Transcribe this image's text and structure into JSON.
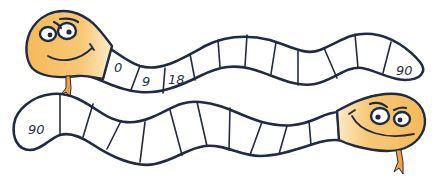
{
  "puzzle": {
    "description": "Two snake number tracks counting by 9 from 0 to 90",
    "colors": {
      "outline": "#1f2a44",
      "head_fill": "#f7c06b",
      "head_highlight": "#fde7bf",
      "tongue": "#f5a23a",
      "body_fill": "#ffffff"
    },
    "top_snake": {
      "direction": "left-to-right",
      "cells": [
        "0",
        "9",
        "18",
        "",
        "",
        "",
        "",
        "",
        "",
        "",
        "90"
      ]
    },
    "bottom_snake": {
      "direction": "right-to-left",
      "cells": [
        "90",
        "",
        "",
        "",
        "",
        "",
        "",
        "",
        "",
        "",
        "",
        "",
        "",
        "",
        ""
      ]
    }
  }
}
